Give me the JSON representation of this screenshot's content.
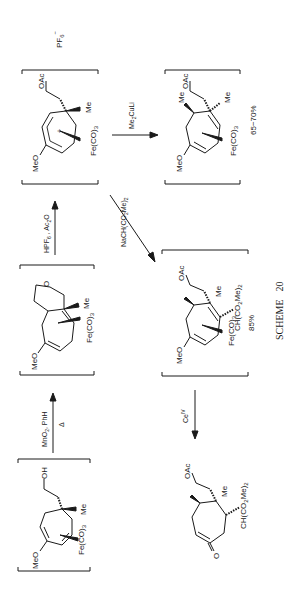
{
  "scheme": {
    "caption": "SCHEME   20",
    "title_word": "SCHEME",
    "number": "20"
  },
  "compounds": [
    {
      "id": "diene-alcohol",
      "bracketed": true,
      "labels": {
        "metal": "Fe(CO)",
        "metal_sub": "3",
        "ome": "MeO",
        "sidechain": "OH",
        "me": "Me"
      }
    },
    {
      "id": "bicyclic-ether",
      "bracketed": true,
      "labels": {
        "metal": "Fe(CO)",
        "metal_sub": "3",
        "ome": "MeO",
        "ring_o": "O",
        "me": "Me"
      }
    },
    {
      "id": "dienyl-cation",
      "bracketed": true,
      "labels": {
        "metal": "Fe(CO)",
        "metal_sub": "3",
        "ome": "MeO",
        "sidechain": "OAc",
        "me": "Me",
        "charge": "+",
        "counterion": "PF",
        "counterion_sub": "6",
        "counterion_sup": "−"
      }
    },
    {
      "id": "methyl-adduct",
      "bracketed": true,
      "labels": {
        "metal": "Fe(CO)",
        "metal_sub": "3",
        "ome": "MeO",
        "sidechain": "OAc",
        "me": "Me",
        "me2": "Me"
      },
      "yield": "65−70%"
    },
    {
      "id": "malonate-adduct",
      "bracketed": true,
      "labels": {
        "metal": "Fe(CO)",
        "metal_sub": "3",
        "ome": "MeO",
        "sidechain": "OAc",
        "me": "Me",
        "substituent": "CH(CO",
        "substituent_sub": "2",
        "substituent_tail": "Me)",
        "substituent_tail_sub": "2"
      },
      "yield": "85%"
    },
    {
      "id": "enone-product",
      "bracketed": false,
      "labels": {
        "ketone_o": "O",
        "sidechain": "OAc",
        "me": "Me",
        "substituent": "CH(CO",
        "substituent_sub": "2",
        "substituent_tail": "Me)",
        "substituent_tail_sub": "2"
      }
    }
  ],
  "arrows": [
    {
      "id": "step1",
      "reagent_top": "MnO",
      "reagent_top_sub": "2",
      "reagent_top_tail": ", PhH",
      "reagent_bottom": "Δ"
    },
    {
      "id": "step2",
      "reagent_top": "HPF",
      "reagent_top_sub": "6",
      "reagent_top_tail": " , Ac",
      "reagent_top_tail_sub": "2",
      "reagent_top_end": "O"
    },
    {
      "id": "step3",
      "reagent": "Me",
      "reagent_sub": "2",
      "reagent_tail": "CuLi"
    },
    {
      "id": "step4",
      "reagent": "NaCH(CO",
      "reagent_sub": "2",
      "reagent_tail": "Me)",
      "reagent_tail_sub": "2"
    },
    {
      "id": "step5",
      "reagent": "Ce",
      "reagent_sup": "IV"
    }
  ],
  "colors": {
    "ink": "#1a1a1a",
    "background": "#ffffff"
  }
}
